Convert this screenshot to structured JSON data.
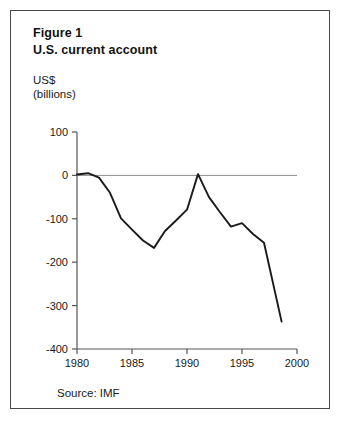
{
  "figure": {
    "label": "Figure 1",
    "title": "U.S. current account",
    "unit_line1": "US$",
    "unit_line2": "(billions)",
    "source": "Source: IMF"
  },
  "chart_data": {
    "type": "line",
    "title": "U.S. current account",
    "subtitle": "Figure 1",
    "xlabel": "",
    "ylabel": "US$ (billions)",
    "xlim": [
      1980,
      2000
    ],
    "ylim": [
      -400,
      100
    ],
    "xticks": [
      1980,
      1985,
      1990,
      1995,
      2000
    ],
    "yticks": [
      100,
      0,
      -100,
      -200,
      -300,
      -400
    ],
    "xtick_labels": [
      "1980",
      "1985",
      "1990",
      "1995",
      "2000"
    ],
    "ytick_labels": [
      "100",
      "0",
      "-100",
      "-200",
      "-300",
      "-400"
    ],
    "grid": false,
    "legend": "none",
    "zero_line": true,
    "line_color": "#1a1a1a",
    "axis_color": "#555555",
    "source": "Source: IMF",
    "series": [
      {
        "name": "U.S. current account balance",
        "x": [
          1980,
          1981,
          1982,
          1983,
          1984,
          1985,
          1986,
          1987,
          1988,
          1989,
          1990,
          1991,
          1992,
          1993,
          1994,
          1995,
          1996,
          1997,
          1998.6
        ],
        "values": [
          2,
          5,
          -5,
          -40,
          -99,
          -125,
          -150,
          -167,
          -128,
          -104,
          -79,
          3,
          -50,
          -85,
          -118,
          -110,
          -135,
          -155,
          -337
        ]
      }
    ],
    "annotations": [
      {
        "text": "trough",
        "x": 1987,
        "y": -167
      },
      {
        "text": "peak near balance",
        "x": 1991,
        "y": 3
      }
    ]
  }
}
